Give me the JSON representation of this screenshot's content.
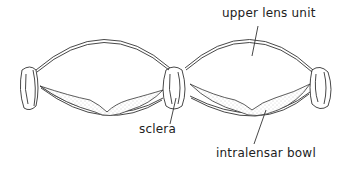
{
  "diagram": {
    "stroke_color": "#333333",
    "stipple_color": "#bbbbbb",
    "labels": {
      "upper_lens_unit": "upper lens unit",
      "sclera": "sclera",
      "intralensar_bowl": "intralensar bowl"
    }
  }
}
